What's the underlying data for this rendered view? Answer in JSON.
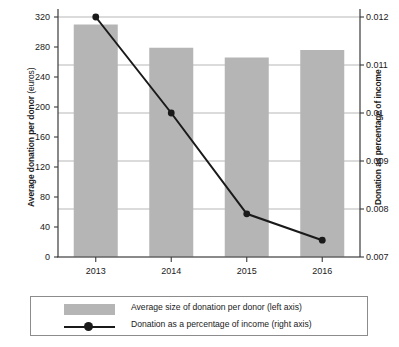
{
  "chart_data": {
    "type": "bar",
    "title": "",
    "subtitle": "",
    "categories": [
      "2013",
      "2014",
      "2015",
      "2016"
    ],
    "xlabel": "",
    "ylabel": "Average donation per donor (euros)",
    "y2label": "Donation as percentage of income",
    "ylim": [
      0,
      320
    ],
    "y2lim": [
      0.007,
      0.012
    ],
    "yticks": [
      0,
      40,
      80,
      120,
      160,
      200,
      240,
      280,
      320
    ],
    "ytick_labels": [
      "0",
      "40",
      "80",
      "120",
      "160",
      "200",
      "240",
      "280",
      "320"
    ],
    "y2ticks": [
      0.007,
      0.008,
      0.009,
      0.01,
      0.011,
      0.012
    ],
    "y2tick_labels": [
      "0.007",
      "0.008",
      "0.009",
      "0.01",
      "0.011",
      "0.012"
    ],
    "grid": true,
    "legend_position": "bottom",
    "series": [
      {
        "name": "Average size of donation per donor (left axis)",
        "type": "bar",
        "axis": "left",
        "color": "#b5b5b5",
        "values": [
          310,
          279,
          266,
          276
        ]
      },
      {
        "name": "Donation as a percentage of income (right axis)",
        "type": "line",
        "axis": "right",
        "color": "#1a1a1a",
        "marker": "circle",
        "values": [
          0.012,
          0.01,
          0.0079,
          0.00735
        ]
      }
    ]
  },
  "axes": {
    "left_title_main": "Average donation per donor",
    "left_title_unit": " (euros)",
    "right_title": "Donation as percentage of income"
  },
  "legend": {
    "items": [
      {
        "label": "Average size of donation per donor (left axis)",
        "marker": "bar-swatch"
      },
      {
        "label": "Donation as a percentage of income (right axis)",
        "marker": "line-circle"
      }
    ]
  }
}
